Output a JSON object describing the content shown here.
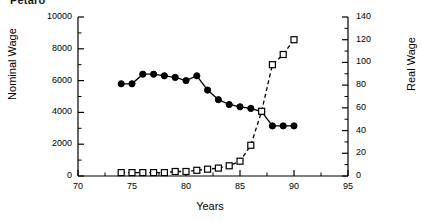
{
  "clipped_title": "Petaro",
  "axes": {
    "x": {
      "label": "Years",
      "min": 70,
      "max": 95,
      "ticks": [
        70,
        75,
        80,
        85,
        90,
        95
      ],
      "minor_step": 2.5
    },
    "y_left": {
      "label": "Nominal Wage",
      "min": 0,
      "max": 10000,
      "ticks": [
        0,
        2000,
        4000,
        6000,
        8000,
        10000
      ],
      "minor_step": 1000
    },
    "y_right": {
      "label": "Real Wage",
      "min": 0,
      "max": 140,
      "ticks": [
        0,
        20,
        40,
        60,
        80,
        100,
        120,
        140
      ],
      "minor_step": 10
    }
  },
  "chart_data": {
    "type": "line",
    "title": "Petaro",
    "xlabel": "Years",
    "ylabel": "Nominal Wage",
    "ylabel_right": "Real Wage",
    "xlim": [
      70,
      95
    ],
    "ylim": [
      0,
      10000
    ],
    "ylim_right": [
      0,
      140
    ],
    "grid": false,
    "legend": "none",
    "series": [
      {
        "name": "Nominal Wage",
        "axis": "left",
        "marker": "filled-circle",
        "line": "solid",
        "color": "#000000",
        "x": [
          74,
          75,
          76,
          77,
          78,
          79,
          80,
          81,
          82,
          83,
          84,
          85,
          86,
          87,
          88,
          89,
          90
        ],
        "values": [
          5800,
          5800,
          6400,
          6400,
          6300,
          6200,
          6000,
          6300,
          5400,
          4800,
          4500,
          4350,
          4250,
          4050,
          3150,
          3150,
          3150
        ]
      },
      {
        "name": "Real Wage",
        "axis": "right",
        "marker": "open-square",
        "line": "dashed",
        "color": "#000000",
        "x": [
          74,
          75,
          76,
          77,
          78,
          79,
          80,
          81,
          82,
          83,
          84,
          85,
          86,
          87,
          88,
          89,
          90
        ],
        "values": [
          3,
          3,
          3,
          3,
          3,
          4,
          4,
          5,
          6,
          7,
          9,
          13,
          27,
          57,
          98,
          107,
          120
        ]
      }
    ]
  }
}
